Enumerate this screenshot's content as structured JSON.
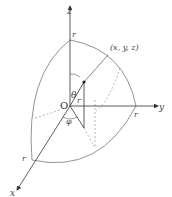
{
  "diagram": {
    "axes": {
      "z": {
        "label": "z"
      },
      "y": {
        "label": "y"
      },
      "x": {
        "label": "x"
      }
    },
    "origin_label": "O",
    "radius_labels": {
      "z": "r",
      "y": "r",
      "x": "r",
      "point": "r"
    },
    "point_label": "(x, y, z)",
    "angles": {
      "theta": "θ",
      "phi": "φ"
    },
    "colors": {
      "line": "#555555",
      "dashed": "#999999",
      "text": "#444444"
    }
  }
}
